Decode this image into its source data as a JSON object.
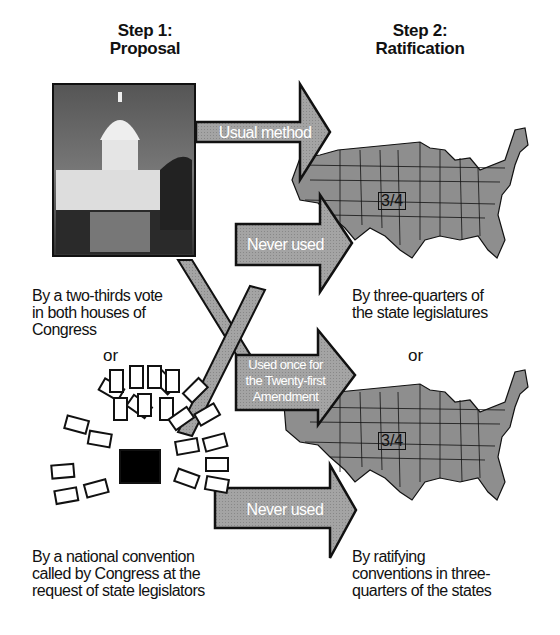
{
  "step1": {
    "title_line1": "Step 1:",
    "title_line2": "Proposal"
  },
  "step2": {
    "title_line1": "Step 2:",
    "title_line2": "Ratification"
  },
  "proposal_methods": [
    {
      "label": "By a two-thirds vote in both houses of Congress",
      "lines": [
        "By a two-thirds vote",
        "in both houses of",
        "Congress"
      ],
      "image": "us-capitol-photo"
    },
    {
      "label": "By a national convention called by Congress at the request of state legislators",
      "lines": [
        "By a national convention",
        "called by Congress at the",
        "request of state legislators"
      ],
      "image": "convention-seating-diagram"
    }
  ],
  "ratification_methods": [
    {
      "lines": [
        "By three-quarters of",
        "the state legislatures"
      ],
      "fraction": "3/4"
    },
    {
      "lines": [
        "By ratifying",
        "conventions in three-",
        "quarters of the states"
      ],
      "fraction": "3/4"
    }
  ],
  "or_label": "or",
  "arrows": {
    "usual": "Usual method",
    "never1": "Never used",
    "once_lines": [
      "Used once for",
      "the Twenty-first",
      "Amendment"
    ],
    "never2": "Never used"
  },
  "colors": {
    "arrow_fill": "#9c9c9c",
    "map_fill": "#8e8e8e",
    "outline": "#111111"
  }
}
